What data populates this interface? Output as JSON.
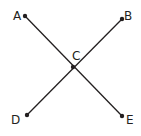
{
  "diagram": {
    "title": "",
    "colors": {
      "stroke": "#231f20",
      "background": "#ffffff"
    },
    "points": [
      {
        "id": "A",
        "label": "A",
        "x": 25,
        "y": 16,
        "label_x": 13,
        "label_y": 20
      },
      {
        "id": "B",
        "label": "B",
        "x": 122,
        "y": 19,
        "label_x": 124,
        "label_y": 20
      },
      {
        "id": "C",
        "label": "C",
        "x": 73,
        "y": 67,
        "label_x": 72,
        "label_y": 60
      },
      {
        "id": "D",
        "label": "D",
        "x": 27,
        "y": 115,
        "label_x": 11,
        "label_y": 124
      },
      {
        "id": "E",
        "label": "E",
        "x": 122,
        "y": 116,
        "label_x": 126,
        "label_y": 124
      }
    ],
    "segments": [
      {
        "id": "AE",
        "from": "A",
        "to": "E"
      },
      {
        "id": "BD",
        "from": "B",
        "to": "D"
      }
    ],
    "intersection": "C"
  }
}
